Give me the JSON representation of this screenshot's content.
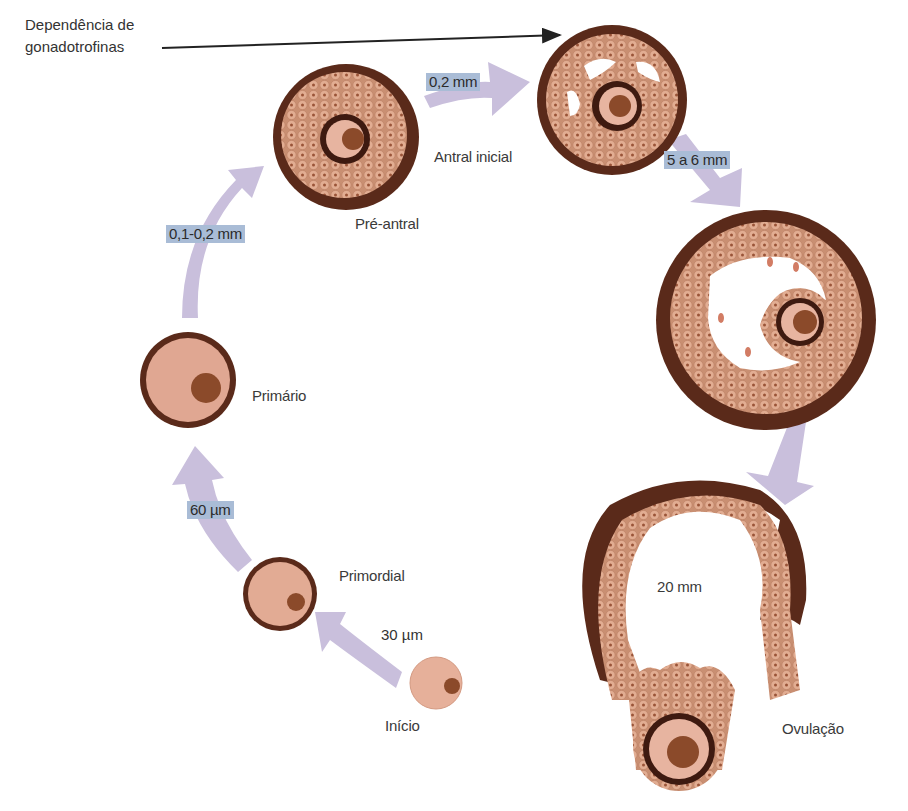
{
  "diagram": {
    "title_note": "Dependência de gonadotrofinas",
    "title_note_lines": [
      "Dependência de",
      "gonadotrofinas"
    ],
    "colors": {
      "theca": "#5a2a1a",
      "granulosa": "#d9a488",
      "cell_nucleus": "#8a4a32",
      "oocyte": "#e8b29c",
      "nucleus": "#8b4a2a",
      "arrow": "#c9bfdc",
      "size_label_bg": "#a9bcd6"
    },
    "stages": [
      {
        "id": "inicio",
        "label": "Início"
      },
      {
        "id": "primordial",
        "label": "Primordial"
      },
      {
        "id": "primario",
        "label": "Primário"
      },
      {
        "id": "pre-antral",
        "label": "Pré-antral"
      },
      {
        "id": "antral-inicial",
        "label": "Antral inicial"
      },
      {
        "id": "antral",
        "label": ""
      },
      {
        "id": "pre-ovulatorio",
        "label": "20 mm"
      },
      {
        "id": "ovulacao",
        "label": "Ovulação"
      }
    ],
    "transitions": [
      {
        "from": "inicio",
        "to": "primordial",
        "size": "30 µm",
        "highlight": false
      },
      {
        "from": "primordial",
        "to": "primario",
        "size": "60 µm",
        "highlight": true
      },
      {
        "from": "primario",
        "to": "pre-antral",
        "size": "0,1-0,2 mm",
        "highlight": true
      },
      {
        "from": "pre-antral",
        "to": "antral-inicial",
        "size": "0,2 mm",
        "highlight": true
      },
      {
        "from": "antral-inicial",
        "to": "antral",
        "size": "5 a 6 mm",
        "highlight": true
      },
      {
        "from": "antral",
        "to": "pre-ovulatorio",
        "size": "",
        "highlight": false
      }
    ]
  }
}
